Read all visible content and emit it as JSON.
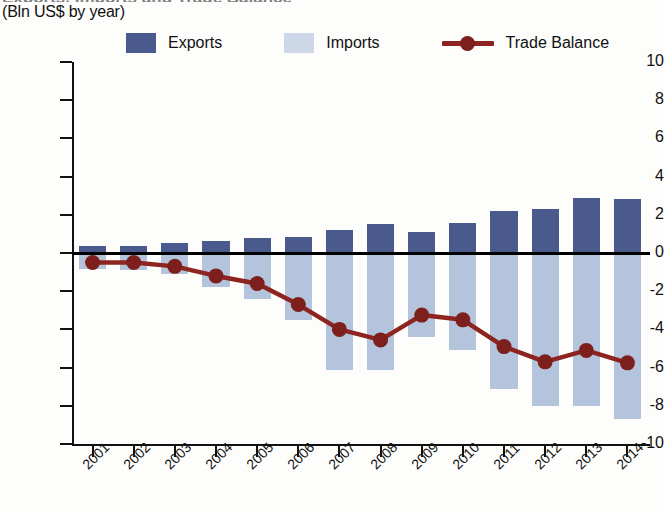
{
  "header": {
    "title_cut": "Exports, Imports and Trade Balance",
    "subtitle": "(Bln US$ by year)"
  },
  "legend": {
    "items": [
      {
        "label": "Exports",
        "type": "swatch",
        "color": "#4a5a8d"
      },
      {
        "label": "Imports",
        "type": "swatch",
        "color": "#b3c4dc"
      },
      {
        "label": "Trade Balance",
        "type": "line",
        "color": "#8e2420"
      }
    ]
  },
  "axes": {
    "y_ticks": [
      "10",
      "8",
      "6",
      "4",
      "2",
      "0",
      "-2",
      "-4",
      "-6",
      "-8",
      "-10"
    ],
    "x_ticks": [
      "2001",
      "2002",
      "2003",
      "2004",
      "2005",
      "2006",
      "2007",
      "2008",
      "2009",
      "2010",
      "2011",
      "2012",
      "2013",
      "2014"
    ]
  },
  "chart_data": {
    "type": "bar",
    "title": "Exports, Imports and Trade Balance",
    "subtitle": "(Bln US$ by year)",
    "xlabel": "",
    "ylabel": "Bln US$",
    "ylim": [
      -10,
      10
    ],
    "ytick_step": 2,
    "grid": false,
    "legend_position": "top",
    "categories": [
      "2001",
      "2002",
      "2003",
      "2004",
      "2005",
      "2006",
      "2007",
      "2008",
      "2009",
      "2010",
      "2011",
      "2012",
      "2013",
      "2014"
    ],
    "series": [
      {
        "name": "Exports",
        "type": "bar",
        "color": "#4a5a8d",
        "values": [
          0.35,
          0.35,
          0.5,
          0.65,
          0.8,
          0.85,
          1.2,
          1.5,
          1.1,
          1.55,
          2.2,
          2.3,
          2.9,
          2.85
        ]
      },
      {
        "name": "Imports",
        "type": "bar",
        "color": "#b3c4dc",
        "values": [
          -0.85,
          -0.9,
          -1.1,
          -1.8,
          -2.4,
          -3.5,
          -6.1,
          -6.1,
          -4.4,
          -5.1,
          -7.1,
          -8.0,
          -8.0,
          -8.7
        ]
      },
      {
        "name": "Trade Balance",
        "type": "line",
        "color": "#8e2420",
        "values": [
          -0.5,
          -0.5,
          -0.7,
          -1.2,
          -1.6,
          -2.7,
          -4.0,
          -4.55,
          -3.25,
          -3.5,
          -4.9,
          -5.7,
          -5.1,
          -5.75
        ]
      }
    ]
  }
}
